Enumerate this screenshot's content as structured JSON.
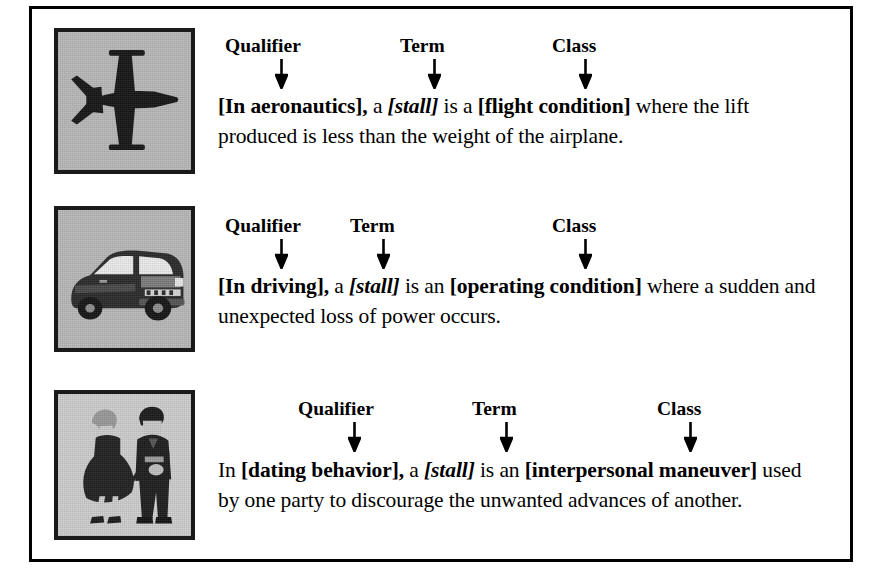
{
  "figure": {
    "background_color": "#ffffff",
    "border_color": "#000000",
    "thumb_background_color": "#b9b9b9"
  },
  "annotation_labels": {
    "qualifier": "Qualifier",
    "term": "Term",
    "class": "Class"
  },
  "senses": [
    {
      "id": "aeronautics",
      "image_name": "airplane-top-view-thumbnail",
      "image_alt": "top-down silhouette of a jet airplane",
      "labels": [
        "Qualifier",
        "Term",
        "Class"
      ],
      "definition_plain": "[In aeronautics], a [stall] is a [flight condition] where the lift produced is less than the weight of the airplane.",
      "parts": [
        {
          "text": "[In aeronautics],",
          "style": "bold"
        },
        {
          "text": " a ",
          "style": "plain"
        },
        {
          "text": "[stall]",
          "style": "bold-italic"
        },
        {
          "text": " is a ",
          "style": "plain"
        },
        {
          "text": "[flight condition]",
          "style": "bold"
        },
        {
          "text": " where the lift produced is less than the weight of the airplane.",
          "style": "plain"
        }
      ]
    },
    {
      "id": "driving",
      "image_name": "car-thumbnail",
      "image_alt": "three-quarter view drawing of a sedan car",
      "labels": [
        "Qualifier",
        "Term",
        "Class"
      ],
      "definition_plain": "[In driving], a [stall] is an [operating condition] where a sudden and unexpected loss of power occurs.",
      "parts": [
        {
          "text": "[In driving],",
          "style": "bold"
        },
        {
          "text": " a ",
          "style": "plain"
        },
        {
          "text": "[stall]",
          "style": "bold-italic"
        },
        {
          "text": " is an ",
          "style": "plain"
        },
        {
          "text": "[operating condition]",
          "style": "bold"
        },
        {
          "text": " where a sudden and unexpected loss of power occurs.",
          "style": "plain"
        }
      ]
    },
    {
      "id": "dating",
      "image_name": "dancing-couple-thumbnail",
      "image_alt": "drawing of a woman in a dress and a man in a suit standing",
      "labels": [
        "Qualifier",
        "Term",
        "Class"
      ],
      "definition_plain": "In [dating behavior], a [stall] is an [interpersonal maneuver] used by one party to discourage the unwanted advances of another.",
      "parts": [
        {
          "text": "In ",
          "style": "plain"
        },
        {
          "text": "[dating behavior],",
          "style": "bold"
        },
        {
          "text": " a ",
          "style": "plain"
        },
        {
          "text": "[stall]",
          "style": "bold-italic"
        },
        {
          "text": " is an ",
          "style": "plain"
        },
        {
          "text": "[interpersonal maneuver]",
          "style": "bold"
        },
        {
          "text": " used by one party to discourage the unwanted advances of another.",
          "style": "plain"
        }
      ]
    }
  ]
}
